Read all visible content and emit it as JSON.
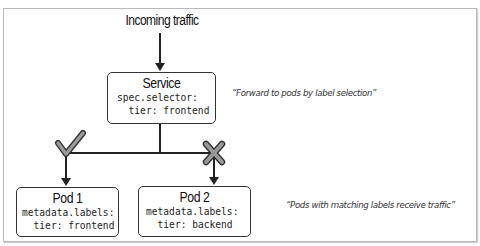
{
  "diagram": {
    "title": "Incoming traffic",
    "service": {
      "name": "Service",
      "code_line1": "spec.selector:",
      "code_line2": "  tier: frontend"
    },
    "pods": [
      {
        "name": "Pod 1",
        "code_line1": "metadata.labels:",
        "code_line2": "  tier: frontend",
        "match": "checkmark-icon"
      },
      {
        "name": "Pod 2",
        "code_line1": "metadata.labels:",
        "code_line2": "  tier: backend",
        "match": "x-mark-icon"
      }
    ],
    "annotations": {
      "service_note": "“Forward to pods by label selection”",
      "pods_note": "“Pods with matching labels receive traffic”"
    },
    "colors": {
      "line": "#222222",
      "mark_fill": "#9a9a9a",
      "mark_stroke": "#333333",
      "frame": "#b9b9b9"
    }
  }
}
